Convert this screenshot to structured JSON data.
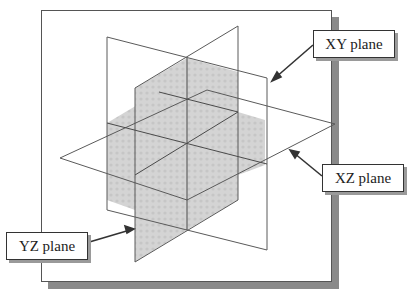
{
  "diagram": {
    "labels": {
      "xy": "XY plane",
      "xz": "XZ plane",
      "yz": "YZ plane"
    },
    "colors": {
      "line": "#555555",
      "shade": "#d2d2d2",
      "frame_shadow": "#8a8a8a",
      "arrow": "#333333"
    }
  }
}
